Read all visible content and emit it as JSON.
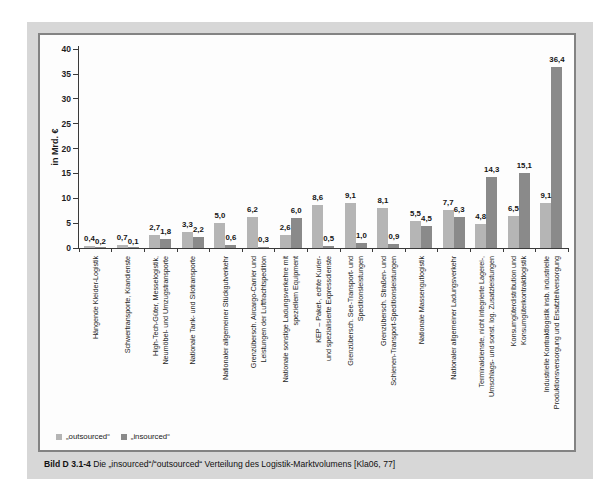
{
  "figure": {
    "caption_label": "Bild D 3.1-4",
    "caption_text": "Die „insourced“/“outsourced“ Verteilung des Logistik-Marktvolumens [Kla06, 77]"
  },
  "colors": {
    "outsourced": "#b5b5b5",
    "insourced": "#8a8a8a",
    "axis": "#3a3a3a",
    "figure_background": "#d7d7d7",
    "panel_border": "#838383"
  },
  "legend": [
    {
      "label": "„outsourced“",
      "series": "outsourced"
    },
    {
      "label": "„insourced“",
      "series": "insourced"
    }
  ],
  "chart_data": {
    "type": "bar",
    "title": "",
    "xlabel": "",
    "ylabel": "in Mrd. €",
    "ylim": [
      0,
      40
    ],
    "yticks": [
      0,
      5,
      10,
      15,
      20,
      25,
      30,
      35,
      40
    ],
    "grid": false,
    "legend_position": "bottom-left",
    "value_label_decimal": "comma",
    "categories": [
      "Hängende Kleider-Logistik",
      "Schwertransporte, Krandienste",
      "High-Tech-Güter, Messelogistik,\nNeumöbel- und Umzugstransporte",
      "Nationale Tank- und Silotransporte",
      "Nationaler allgemeiner Stückgutverkehr",
      "Grenzübersch. Aircargo-Carrier und\nLeistungen der Luftfrachtspedition",
      "Nationale sonstige Ladungsverkehre mit\nspeziellem Equipment",
      "KEP – Paket-, echte Kurier-\nund spezialisierte Expressdienste",
      "Grenzübersch. See-Transport- und\nSpeditionsleistungen",
      "Grenzübersch. Straßen- und\nSchienen-Transport-Speditionsleistungen",
      "Nationale Massengutlogistik",
      "Nationaler allgemeiner Ladungsverkehr",
      "Terminaldienste, nicht integrierte Lagerei-,\nUmschlags- und sonst. log. Zusatzleistungen",
      "Konsumgüterdistribution und\nKonsumgüterkontraktlogistik",
      "Industrielle Kontraktlogistik insb. industrielle\nProduktionsversorgung und Ersatzteilversorgung"
    ],
    "series": [
      {
        "name": "„outsourced“",
        "key": "outsourced",
        "values": [
          0.4,
          0.7,
          2.7,
          3.3,
          5.0,
          6.2,
          2.6,
          8.6,
          9.1,
          8.1,
          5.5,
          7.7,
          4.8,
          6.5,
          9.1
        ]
      },
      {
        "name": "„insourced“",
        "key": "insourced",
        "values": [
          0.2,
          0.1,
          1.8,
          2.2,
          0.6,
          0.3,
          6.0,
          0.5,
          1.0,
          0.9,
          4.5,
          6.3,
          14.3,
          15.1,
          36.4
        ]
      }
    ]
  }
}
